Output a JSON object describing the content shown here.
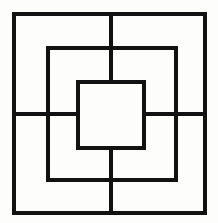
{
  "figure": {
    "type": "line-drawing",
    "canvas": {
      "width": 218,
      "height": 223,
      "background_color": "#fdfdfb",
      "stroke_color": "#121212",
      "stroke_width": 3.6
    },
    "shapes": [
      {
        "name": "outer-square",
        "kind": "rect",
        "x": 14,
        "y": 14,
        "width": 191,
        "height": 199,
        "label": "Outer square"
      },
      {
        "name": "middle-square",
        "kind": "rect",
        "x": 48,
        "y": 48,
        "width": 128,
        "height": 132,
        "label": "Middle square"
      },
      {
        "name": "inner-square",
        "kind": "rect",
        "x": 78,
        "y": 82,
        "width": 66,
        "height": 66,
        "label": "Inner square"
      },
      {
        "name": "vertical-center-line",
        "kind": "line",
        "x1": 111,
        "y1": 14,
        "x2": 111,
        "y2": 213,
        "label": "Vertical center line"
      },
      {
        "name": "horizontal-center-line",
        "kind": "line",
        "x1": 14,
        "y1": 114,
        "x2": 205,
        "y2": 114,
        "label": "Horizontal center line"
      }
    ],
    "notes": {
      "square_count": "3",
      "line_count": "2",
      "description": "Three concentric squares crossed by one full-width horizontal line and one full-height vertical line; the center square interior is clear of the cross."
    }
  }
}
